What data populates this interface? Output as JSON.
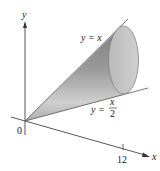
{
  "figure": {
    "type": "solid-of-revolution",
    "axes": {
      "x_label": "x",
      "y_label": "y",
      "origin_label": "0",
      "x_tick_label": "12"
    },
    "curves": [
      {
        "label": "y = x",
        "text": "y = x"
      },
      {
        "label_prefix": "y = ",
        "numerator": "x",
        "denominator": "2"
      }
    ],
    "colors": {
      "axis": "#333333",
      "cone_dark": "#8a8a8a",
      "cone_light": "#d6d6d6",
      "ellipse_fill": "#c8c8c8",
      "ellipse_stroke": "#777777"
    }
  }
}
